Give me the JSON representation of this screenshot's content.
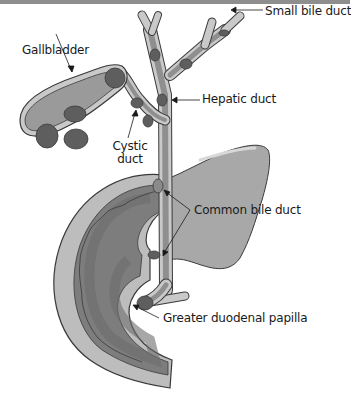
{
  "diagram": {
    "type": "anatomical-illustration",
    "labels": {
      "gallbladder": "Gallbladder",
      "small_bile_duct": "Small bile duct",
      "hepatic_duct": "Hepatic duct",
      "cystic_duct_line1": "Cystic",
      "cystic_duct_line2": "duct",
      "common_bile_duct": "Common bile duct",
      "greater_duodenal_papilla": "Greater duodenal papilla"
    },
    "colors": {
      "border": "#8e8e8e",
      "outline": "#3a3a3a",
      "duct_wall": "#c9c9c9",
      "duct_lumen": "#8f8f8f",
      "gallbladder_fill": "#9a9a9a",
      "stone": "#5e5e5e",
      "pancreas": "#a8a8a8",
      "duodenum_outer": "#bdbdbd",
      "duodenum_inner": "#7d7d7d",
      "duodenum_core": "#6c6c6c"
    }
  }
}
